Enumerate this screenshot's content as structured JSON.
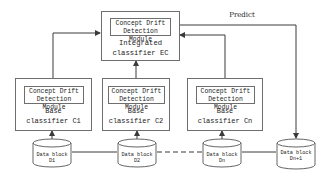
{
  "diagram": {
    "integrated": {
      "module_line1": "Concept Drift",
      "module_line2": "Detection Module",
      "title_line1": "Integrated",
      "title_line2": "classifier EC"
    },
    "predict_label": "Predict",
    "base_classifiers": [
      {
        "module_line1": "Concept Drift",
        "module_line2": "Detection Module",
        "title_line1": "Base",
        "title_line2": "classifier C1"
      },
      {
        "module_line1": "Concept Drift",
        "module_line2": "Detection Module",
        "title_line1": "Base",
        "title_line2": "classifier C2"
      },
      {
        "module_line1": "Concept Drift",
        "module_line2": "Detection Module",
        "title_line1": "Base",
        "title_line2": "classifier Cn"
      }
    ],
    "data_blocks": [
      {
        "line1": "Data block D1",
        "line2": ""
      },
      {
        "line1": "Data block D2",
        "line2": ""
      },
      {
        "line1": "Data block Dn",
        "line2": ""
      },
      {
        "line1": "Data block",
        "line2": "Dn+1"
      }
    ],
    "colors": {
      "line": "#4a4a4a",
      "box_border": "#6e6e6e",
      "background": "#ffffff"
    }
  }
}
